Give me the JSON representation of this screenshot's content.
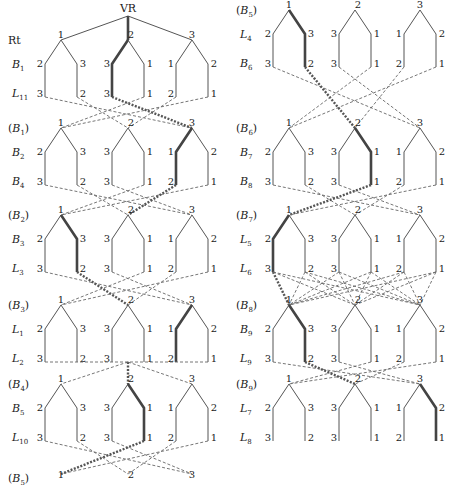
{
  "diagram": {
    "root_label": "VR",
    "colors": {
      "line": "#555555",
      "highlight": "#444444",
      "dash": "#666666",
      "text": "#222222"
    },
    "left_panel": {
      "root_rows": {
        "top": "Rt",
        "mid": "B1",
        "bot": "L11"
      },
      "blocks": [
        {
          "top_label": "Rt",
          "top_paren": false,
          "mid_label": "B",
          "mid_sub": "1",
          "bot_label": "L",
          "bot_sub": "11",
          "highlight_group": 2,
          "highlight_side": "left"
        },
        {
          "top_label": "B",
          "top_sub": "1",
          "top_paren": true,
          "mid_label": "B",
          "mid_sub": "2",
          "bot_label": "B",
          "bot_sub": "4",
          "highlight_group": 3,
          "highlight_side": "left"
        },
        {
          "top_label": "B",
          "top_sub": "2",
          "top_paren": true,
          "mid_label": "B",
          "mid_sub": "3",
          "bot_label": "L",
          "bot_sub": "3",
          "highlight_group": 1,
          "highlight_side": "right"
        },
        {
          "top_label": "B",
          "top_sub": "3",
          "top_paren": true,
          "mid_label": "L",
          "mid_sub": "1",
          "bot_label": "L",
          "bot_sub": "2",
          "highlight_group": 3,
          "highlight_side": "left"
        },
        {
          "top_label": "B",
          "top_sub": "4",
          "top_paren": true,
          "mid_label": "B",
          "mid_sub": "5",
          "bot_label": "L",
          "bot_sub": "10",
          "highlight_group": 2,
          "highlight_side": "right"
        }
      ],
      "final_row": {
        "label": "B",
        "sub": "5",
        "paren": true,
        "nodes": [
          "1",
          "2",
          "3"
        ],
        "highlight_node": 1
      }
    },
    "right_panel": {
      "blocks": [
        {
          "top_label": "B",
          "top_sub": "5",
          "top_paren": true,
          "mid_label": "L",
          "mid_sub": "4",
          "bot_label": "B",
          "bot_sub": "6",
          "highlight_group": 1,
          "highlight_side": "right"
        },
        {
          "top_label": "B",
          "top_sub": "6",
          "top_paren": true,
          "mid_label": "B",
          "mid_sub": "7",
          "bot_label": "B",
          "bot_sub": "8",
          "highlight_group": 2,
          "highlight_side": "right"
        },
        {
          "top_label": "B",
          "top_sub": "7",
          "top_paren": true,
          "mid_label": "L",
          "mid_sub": "5",
          "bot_label": "L",
          "bot_sub": "6",
          "highlight_group": 1,
          "highlight_side": "left"
        },
        {
          "top_label": "B",
          "top_sub": "8",
          "top_paren": true,
          "mid_label": "B",
          "mid_sub": "9",
          "bot_label": "L",
          "bot_sub": "9",
          "highlight_group": 1,
          "highlight_side": "right"
        },
        {
          "top_label": "B",
          "top_sub": "9",
          "top_paren": true,
          "mid_label": "L",
          "mid_sub": "7",
          "bot_label": "L",
          "bot_sub": "8",
          "highlight_group": 3,
          "highlight_side": "right"
        }
      ]
    },
    "group_template": {
      "apex": [
        "1",
        "2",
        "3"
      ],
      "shoulders": [
        [
          "2",
          "3"
        ],
        [
          "3",
          "1"
        ],
        [
          "1",
          "2"
        ]
      ],
      "leaves": [
        [
          "3",
          "2"
        ],
        [
          "3",
          "1"
        ],
        [
          "2",
          "1"
        ]
      ]
    }
  }
}
